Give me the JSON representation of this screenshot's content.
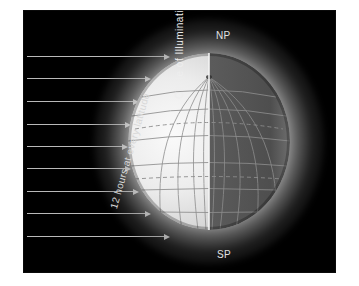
{
  "diagram": {
    "background_color": "#ffffff",
    "panel_color": "#000000",
    "label_color": "#e2e2e2",
    "labels": {
      "north_pole": "NP",
      "south_pole": "SP",
      "terminator": "Circle of Illumination",
      "sun_rays": "12 hours at every latitude"
    },
    "globe": {
      "lit_side": "left",
      "dark_side": "right",
      "lit_color": "#e9e9e9",
      "dark_color": "#585858",
      "halo_color": "#ffffff",
      "graticule_color": "#8a8a8a",
      "terminator_color": "#f2f2f2",
      "meridian_count": 12,
      "parallel_count": 7,
      "dashed_parallels": [
        "Tropic of Cancer",
        "Tropic of Capricorn"
      ]
    },
    "sun_rays": {
      "count": 9,
      "direction": "left-to-right",
      "color": "#b9b9b9",
      "rows": [
        {
          "y": 45,
          "tip": 146
        },
        {
          "y": 67,
          "tip": 127
        },
        {
          "y": 90,
          "tip": 115
        },
        {
          "y": 113,
          "tip": 107
        },
        {
          "y": 135,
          "tip": 104
        },
        {
          "y": 157,
          "tip": 107
        },
        {
          "y": 180,
          "tip": 115
        },
        {
          "y": 202,
          "tip": 127
        },
        {
          "y": 225,
          "tip": 146
        }
      ]
    }
  }
}
